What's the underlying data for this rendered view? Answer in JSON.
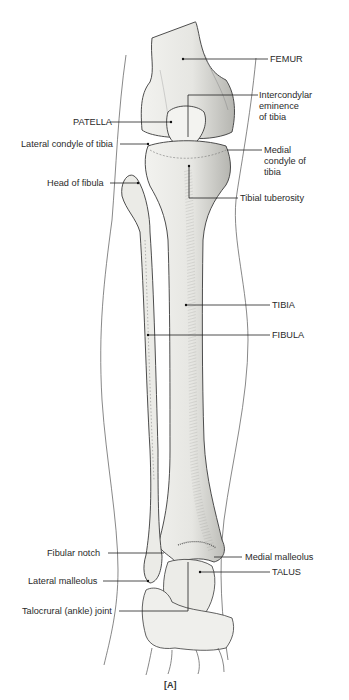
{
  "figure": {
    "caption": "[A]"
  },
  "labels": {
    "femur": "FEMUR",
    "intercondylar": [
      "Intercondylar",
      "eminence",
      "of tibia"
    ],
    "patella": "PATELLA",
    "lateral_condyle": "Lateral condyle of tibia",
    "medial_condyle": [
      "Medial",
      "condyle of",
      "tibia"
    ],
    "head_fibula": "Head of fibula",
    "tibial_tuberosity": "Tibial tuberosity",
    "tibia": "TIBIA",
    "fibula": "FIBULA",
    "fibular_notch": "Fibular notch",
    "medial_malleolus": "Medial malleolus",
    "talus": "TALUS",
    "lateral_malleolus": "Lateral malleolus",
    "talocrural": "Talocrural (ankle) joint"
  },
  "colors": {
    "bone_fill": "#e9e9e6",
    "bone_shade": "#b8b8b4",
    "outline": "#3a3a3a",
    "leader": "#222222"
  }
}
